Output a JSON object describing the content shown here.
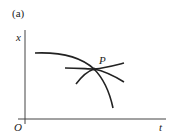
{
  "figure": {
    "panel_label": "(a)",
    "axes": {
      "y_label": "x",
      "x_label": "t",
      "origin_label": "O"
    },
    "point_label": "P",
    "stroke_color": "#222222",
    "curves": [
      {
        "name": "concave-down-curve",
        "path": "M35,53 C60,52 80,56 94,69 C104,79 110,94 113,108"
      },
      {
        "name": "rising-line-curve",
        "path": "M65,68 C78,68 88,69 94,69 C105,68 116,65 124,63"
      },
      {
        "name": "arch-curve",
        "path": "M76,84 C82,76 88,71 94,69 C104,71 116,77 124,82"
      }
    ]
  }
}
